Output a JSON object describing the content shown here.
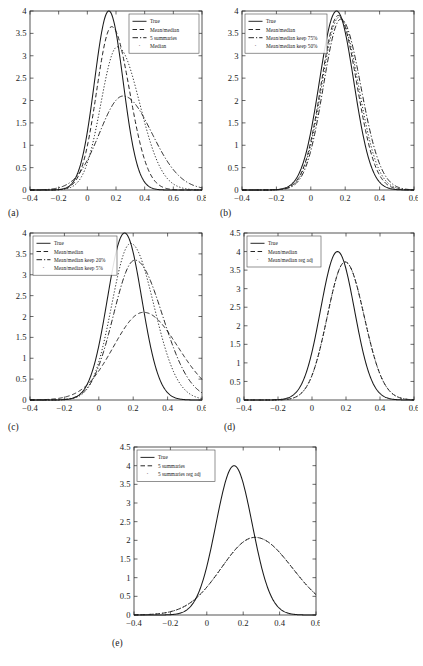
{
  "figure": {
    "type": "multi-panel-density-plot",
    "panel_count": 5,
    "background": "#ffffff",
    "line_color": "#1a1a1a"
  },
  "chart_data": [
    {
      "id": "a",
      "type": "line",
      "panel_label": "(a)",
      "title": "",
      "xlabel": "",
      "ylabel": "",
      "xlim": [
        -0.4,
        0.8
      ],
      "ylim": [
        0,
        4
      ],
      "xticks": [
        -0.4,
        -0.2,
        0,
        0.2,
        0.4,
        0.6,
        0.8
      ],
      "xticklabels": [
        "-0.4",
        "-0.2",
        "0",
        "0.2",
        "0.4",
        "0.6",
        "0.8"
      ],
      "yticks": [
        0,
        0.5,
        1,
        1.5,
        2,
        2.5,
        3,
        3.5,
        4
      ],
      "yticklabels": [
        "0",
        "0.5",
        "1",
        "1.5",
        "2",
        "2.5",
        "3",
        "3.5",
        "4"
      ],
      "grid": false,
      "legend_position": "upper-right",
      "series": [
        {
          "name": "True",
          "style": "solid",
          "peak_x": 0.15,
          "peak_y": 4.0,
          "sigma_left": 0.1,
          "sigma_right": 0.1
        },
        {
          "name": "Mean/median",
          "style": "dashed",
          "peak_x": 0.17,
          "peak_y": 3.65,
          "sigma_left": 0.105,
          "sigma_right": 0.125
        },
        {
          "name": "5 summaries",
          "style": "dashdot",
          "peak_x": 0.25,
          "peak_y": 2.1,
          "sigma_left": 0.165,
          "sigma_right": 0.2
        },
        {
          "name": "Median",
          "style": "dotted",
          "peak_x": 0.21,
          "peak_y": 3.2,
          "sigma_left": 0.115,
          "sigma_right": 0.155
        }
      ]
    },
    {
      "id": "b",
      "type": "line",
      "panel_label": "(b)",
      "title": "",
      "xlabel": "",
      "ylabel": "",
      "xlim": [
        -0.4,
        0.6
      ],
      "ylim": [
        0,
        4
      ],
      "xticks": [
        -0.4,
        -0.2,
        0,
        0.2,
        0.4,
        0.6
      ],
      "xticklabels": [
        "-0.4",
        "-0.2",
        "0",
        "0.2",
        "0.4",
        "0.6"
      ],
      "yticks": [
        0,
        0.5,
        1,
        1.5,
        2,
        2.5,
        3,
        3.5,
        4
      ],
      "yticklabels": [
        "0",
        "0.5",
        "1",
        "1.5",
        "2",
        "2.5",
        "3",
        "3.5",
        "4"
      ],
      "grid": false,
      "legend_position": "upper-left",
      "series": [
        {
          "name": "True",
          "style": "solid",
          "peak_x": 0.15,
          "peak_y": 4.0,
          "sigma_left": 0.1,
          "sigma_right": 0.1
        },
        {
          "name": "Mean/median",
          "style": "dashed",
          "peak_x": 0.16,
          "peak_y": 3.9,
          "sigma_left": 0.1,
          "sigma_right": 0.108
        },
        {
          "name": "Mean/median keep 75%",
          "style": "dashdot",
          "peak_x": 0.175,
          "peak_y": 3.82,
          "sigma_left": 0.102,
          "sigma_right": 0.116
        },
        {
          "name": "Mean/median keep 50%",
          "style": "dotted",
          "peak_x": 0.165,
          "peak_y": 3.86,
          "sigma_left": 0.101,
          "sigma_right": 0.112
        }
      ]
    },
    {
      "id": "c",
      "type": "line",
      "panel_label": "(c)",
      "title": "",
      "xlabel": "",
      "ylabel": "",
      "xlim": [
        -0.4,
        0.6
      ],
      "ylim": [
        0,
        4
      ],
      "xticks": [
        -0.4,
        -0.2,
        0,
        0.2,
        0.4,
        0.6
      ],
      "xticklabels": [
        "-0.4",
        "-0.2",
        "0",
        "0.2",
        "0.4",
        "0.6"
      ],
      "yticks": [
        0,
        0.5,
        1,
        1.5,
        2,
        2.5,
        3,
        3.5,
        4
      ],
      "yticklabels": [
        "0",
        "0.5",
        "1",
        "1.5",
        "2",
        "2.5",
        "3",
        "3.5",
        "4"
      ],
      "grid": false,
      "legend_position": "upper-left",
      "series": [
        {
          "name": "True",
          "style": "solid",
          "peak_x": 0.15,
          "peak_y": 4.0,
          "sigma_left": 0.1,
          "sigma_right": 0.1
        },
        {
          "name": "Mean/median",
          "style": "dashed",
          "peak_x": 0.26,
          "peak_y": 2.1,
          "sigma_left": 0.175,
          "sigma_right": 0.2
        },
        {
          "name": "Mean/median keep 20%",
          "style": "dashdot",
          "peak_x": 0.21,
          "peak_y": 3.35,
          "sigma_left": 0.125,
          "sigma_right": 0.16
        },
        {
          "name": "Mean/median keep 5%",
          "style": "dotted",
          "peak_x": 0.185,
          "peak_y": 3.75,
          "sigma_left": 0.11,
          "sigma_right": 0.135
        }
      ]
    },
    {
      "id": "d",
      "type": "line",
      "panel_label": "(d)",
      "title": "",
      "xlabel": "",
      "ylabel": "",
      "xlim": [
        -0.4,
        0.6
      ],
      "ylim": [
        0,
        4.5
      ],
      "xticks": [
        -0.4,
        -0.2,
        0,
        0.2,
        0.4,
        0.6
      ],
      "xticklabels": [
        "-0.4",
        "-0.2",
        "0",
        "0.2",
        "0.4",
        "0.6"
      ],
      "yticks": [
        0,
        0.5,
        1,
        1.5,
        2,
        2.5,
        3,
        3.5,
        4,
        4.5
      ],
      "yticklabels": [
        "0",
        "0.5",
        "1",
        "1.5",
        "2",
        "2.5",
        "3",
        "3.5",
        "4",
        "4.5"
      ],
      "grid": false,
      "legend_position": "upper-left",
      "series": [
        {
          "name": "True",
          "style": "solid",
          "peak_x": 0.15,
          "peak_y": 4.0,
          "sigma_left": 0.1,
          "sigma_right": 0.1
        },
        {
          "name": "Mean/median",
          "style": "dashed",
          "peak_x": 0.195,
          "peak_y": 3.72,
          "sigma_left": 0.105,
          "sigma_right": 0.112
        },
        {
          "name": "Mean/median reg adj",
          "style": "dotted",
          "peak_x": 0.195,
          "peak_y": 3.72,
          "sigma_left": 0.105,
          "sigma_right": 0.112
        }
      ]
    },
    {
      "id": "e",
      "type": "line",
      "panel_label": "(e)",
      "title": "",
      "xlabel": "",
      "ylabel": "",
      "xlim": [
        -0.4,
        0.6
      ],
      "ylim": [
        0,
        4.5
      ],
      "xticks": [
        -0.4,
        -0.2,
        0,
        0.2,
        0.4,
        0.6
      ],
      "xticklabels": [
        "-0.4",
        "-0.2",
        "0",
        "0.2",
        "0.4",
        "0.6"
      ],
      "yticks": [
        0,
        0.5,
        1,
        1.5,
        2,
        2.5,
        3,
        3.5,
        4,
        4.5
      ],
      "yticklabels": [
        "0",
        "0.5",
        "1",
        "1.5",
        "2",
        "2.5",
        "3",
        "3.5",
        "4",
        "4.5"
      ],
      "grid": false,
      "legend_position": "upper-left",
      "series": [
        {
          "name": "True",
          "style": "solid",
          "peak_x": 0.15,
          "peak_y": 4.0,
          "sigma_left": 0.1,
          "sigma_right": 0.1
        },
        {
          "name": "5 summaries",
          "style": "dashed",
          "peak_x": 0.265,
          "peak_y": 2.08,
          "sigma_left": 0.185,
          "sigma_right": 0.205
        },
        {
          "name": "5 summaries reg adj",
          "style": "dotted",
          "peak_x": 0.265,
          "peak_y": 2.08,
          "sigma_left": 0.185,
          "sigma_right": 0.205
        }
      ]
    }
  ]
}
